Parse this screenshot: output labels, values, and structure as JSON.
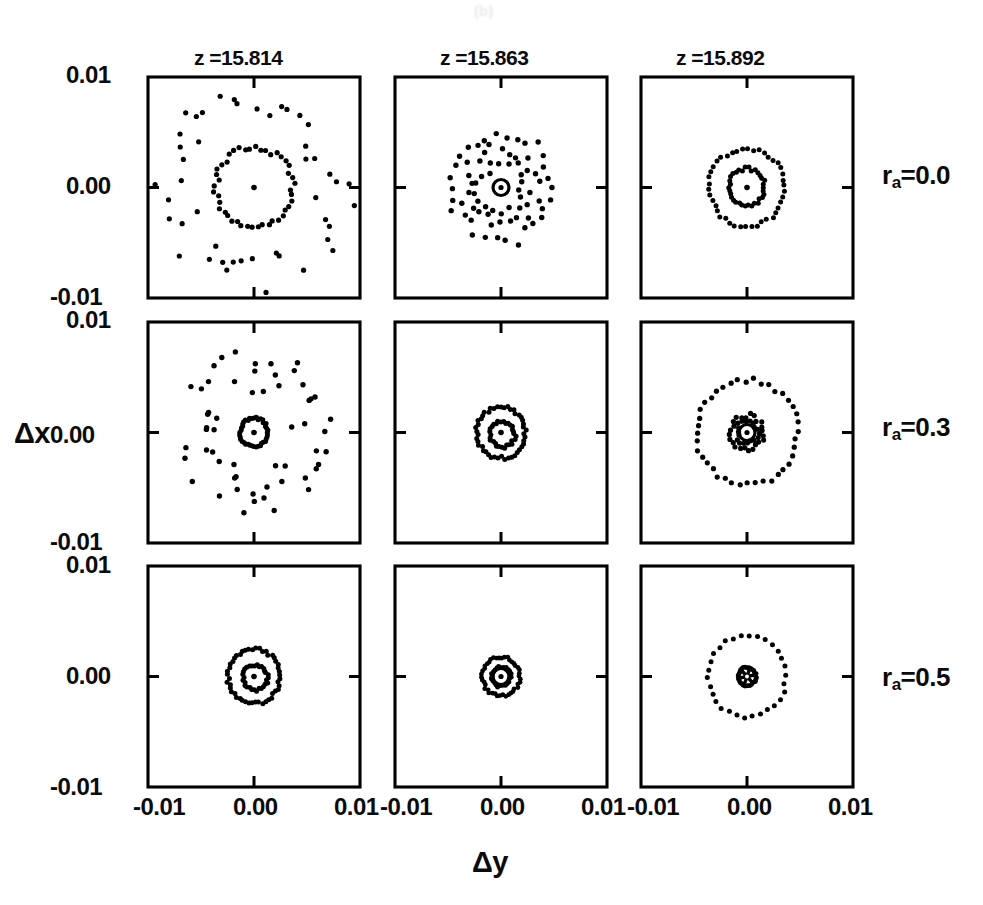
{
  "figure": {
    "axis_x_title": "Δy",
    "axis_y_title": "Δx",
    "artifact_top": "(b)",
    "columns": [
      {
        "title": "z =15.814",
        "z": 15.814
      },
      {
        "title": "z =15.863",
        "z": 15.863
      },
      {
        "title": "z =15.892",
        "z": 15.892
      }
    ],
    "rows": [
      {
        "label_prefix": "r",
        "label_sub": "a",
        "label_eq": "=0.0",
        "r_a": 0.0
      },
      {
        "label_prefix": "r",
        "label_sub": "a",
        "label_eq": "=0.3",
        "r_a": 0.3
      },
      {
        "label_prefix": "r",
        "label_sub": "a",
        "label_eq": "=0.5",
        "r_a": 0.5
      }
    ],
    "x_tick_labels": [
      "-0.01",
      "0.00",
      "0.01"
    ],
    "y_tick_labels": [
      "0.01",
      "0.00",
      "-0.01"
    ],
    "y_title_row_index": 1
  },
  "chart_data": {
    "type": "scatter",
    "title": "",
    "xlabel": "Δy",
    "ylabel": "Δx",
    "xlim": [
      -0.013,
      0.013
    ],
    "ylim": [
      -0.013,
      0.013
    ],
    "xticks": [
      -0.01,
      0.0,
      0.01
    ],
    "yticks": [
      -0.01,
      0.0,
      0.01
    ],
    "grid": false,
    "legend": null,
    "layout": {
      "rows": 3,
      "cols": 3,
      "row_param": "r_a",
      "col_param": "z"
    },
    "panels": [
      {
        "row": 0,
        "col": 0,
        "z": 15.814,
        "r_a": 0.0,
        "description": "sparse scattered outer cloud plus dotted ring and a central point",
        "center_marker": "dot",
        "components": [
          {
            "kind": "ring",
            "radius": 0.0047,
            "n": 44,
            "jitter_r": 0.00035,
            "jitter_t": 0.05,
            "phase": 0.1,
            "size": 2.6
          },
          {
            "kind": "annulus",
            "r_inner": 0.007,
            "r_outer": 0.0125,
            "n": 46,
            "phase": 0.3,
            "size": 2.6
          }
        ]
      },
      {
        "row": 0,
        "col": 1,
        "z": 15.863,
        "r_a": 0.0,
        "description": "broad diffuse disc of dots with open-circle marker at origin",
        "center_marker": "circle-dot",
        "components": [
          {
            "kind": "ring",
            "radius": 0.0062,
            "n": 30,
            "jitter_r": 0.0009,
            "jitter_t": 0.09,
            "phase": 0.0,
            "size": 2.7
          },
          {
            "kind": "ring",
            "radius": 0.0044,
            "n": 26,
            "jitter_r": 0.0009,
            "jitter_t": 0.1,
            "phase": 0.12,
            "size": 2.7
          },
          {
            "kind": "ring",
            "radius": 0.0028,
            "n": 18,
            "jitter_r": 0.0008,
            "jitter_t": 0.12,
            "phase": 0.22,
            "size": 2.7
          }
        ]
      },
      {
        "row": 0,
        "col": 2,
        "z": 15.892,
        "r_a": 0.0,
        "description": "two concentric dotted rings with central point",
        "center_marker": "dot",
        "components": [
          {
            "kind": "ring",
            "radius": 0.0046,
            "n": 42,
            "jitter_r": 0.00025,
            "jitter_t": 0.035,
            "phase": 0.05,
            "size": 2.5
          },
          {
            "kind": "ring",
            "radius": 0.0022,
            "n": 34,
            "jitter_r": 0.00022,
            "jitter_t": 0.04,
            "phase": 0.18,
            "size": 2.5
          }
        ]
      },
      {
        "row": 1,
        "col": 0,
        "z": 15.814,
        "r_a": 0.3,
        "description": "diffuse outer cloud with tight dense inner ring and central point",
        "center_marker": "dot",
        "components": [
          {
            "kind": "ring",
            "radius": 0.0017,
            "n": 40,
            "jitter_r": 0.00015,
            "jitter_t": 0.03,
            "phase": 0.0,
            "size": 2.5
          },
          {
            "kind": "annulus",
            "r_inner": 0.004,
            "r_outer": 0.0098,
            "n": 56,
            "phase": 0.4,
            "size": 2.7
          }
        ]
      },
      {
        "row": 1,
        "col": 1,
        "z": 15.863,
        "r_a": 0.3,
        "description": "two offset concentric dotted rings with central point",
        "center_marker": "dot",
        "components": [
          {
            "kind": "ring",
            "radius": 0.003,
            "n": 46,
            "jitter_r": 0.00022,
            "jitter_t": 0.04,
            "phase": 0.08,
            "size": 2.5
          },
          {
            "kind": "ring",
            "radius": 0.0015,
            "n": 30,
            "jitter_r": 0.0002,
            "jitter_t": 0.06,
            "phase": 0.25,
            "cx": 0.0002,
            "cy": 0.0002,
            "size": 2.5
          }
        ]
      },
      {
        "row": 1,
        "col": 2,
        "z": 15.892,
        "r_a": 0.3,
        "description": "large sparse outer ring with dense central cluster and open-circle marker",
        "center_marker": "circle-dot",
        "components": [
          {
            "kind": "ring",
            "radius": 0.0062,
            "n": 40,
            "jitter_r": 0.0003,
            "jitter_t": 0.04,
            "phase": 0.02,
            "size": 2.6
          },
          {
            "kind": "ring",
            "radius": 0.002,
            "n": 24,
            "jitter_r": 0.0003,
            "jitter_t": 0.07,
            "phase": 0.1,
            "size": 2.6
          },
          {
            "kind": "ring",
            "radius": 0.0013,
            "n": 18,
            "jitter_r": 0.00028,
            "jitter_t": 0.09,
            "phase": 0.26,
            "size": 2.6
          }
        ]
      },
      {
        "row": 2,
        "col": 0,
        "z": 15.814,
        "r_a": 0.5,
        "description": "two concentric dotted rings with central point",
        "center_marker": "dot",
        "components": [
          {
            "kind": "ring",
            "radius": 0.0032,
            "n": 48,
            "jitter_r": 0.0002,
            "jitter_t": 0.035,
            "phase": 0.06,
            "size": 2.5
          },
          {
            "kind": "ring",
            "radius": 0.0015,
            "n": 30,
            "jitter_r": 0.0002,
            "jitter_t": 0.06,
            "phase": 0.2,
            "cx": 0.0002,
            "cy": 0.0001,
            "size": 2.5
          }
        ]
      },
      {
        "row": 2,
        "col": 1,
        "z": 15.863,
        "r_a": 0.5,
        "description": "compact double ring with open-circle marker at origin",
        "center_marker": "circle-dot",
        "components": [
          {
            "kind": "ring",
            "radius": 0.0023,
            "n": 42,
            "jitter_r": 0.00016,
            "jitter_t": 0.035,
            "phase": 0.03,
            "size": 2.4
          },
          {
            "kind": "ring",
            "radius": 0.0012,
            "n": 24,
            "jitter_r": 0.00016,
            "jitter_t": 0.06,
            "phase": 0.22,
            "size": 2.4
          }
        ]
      },
      {
        "row": 2,
        "col": 2,
        "z": 15.892,
        "r_a": 0.5,
        "description": "large sparse outer ring and tight dense inner ring around a star-like core",
        "center_marker": "star",
        "components": [
          {
            "kind": "ring",
            "radius": 0.0048,
            "n": 30,
            "jitter_r": 0.0002,
            "jitter_t": 0.03,
            "phase": 0.04,
            "size": 2.5
          },
          {
            "kind": "ring",
            "radius": 0.0011,
            "n": 30,
            "jitter_r": 0.0001,
            "jitter_t": 0.025,
            "phase": 0.1,
            "size": 2.4
          }
        ]
      }
    ]
  }
}
